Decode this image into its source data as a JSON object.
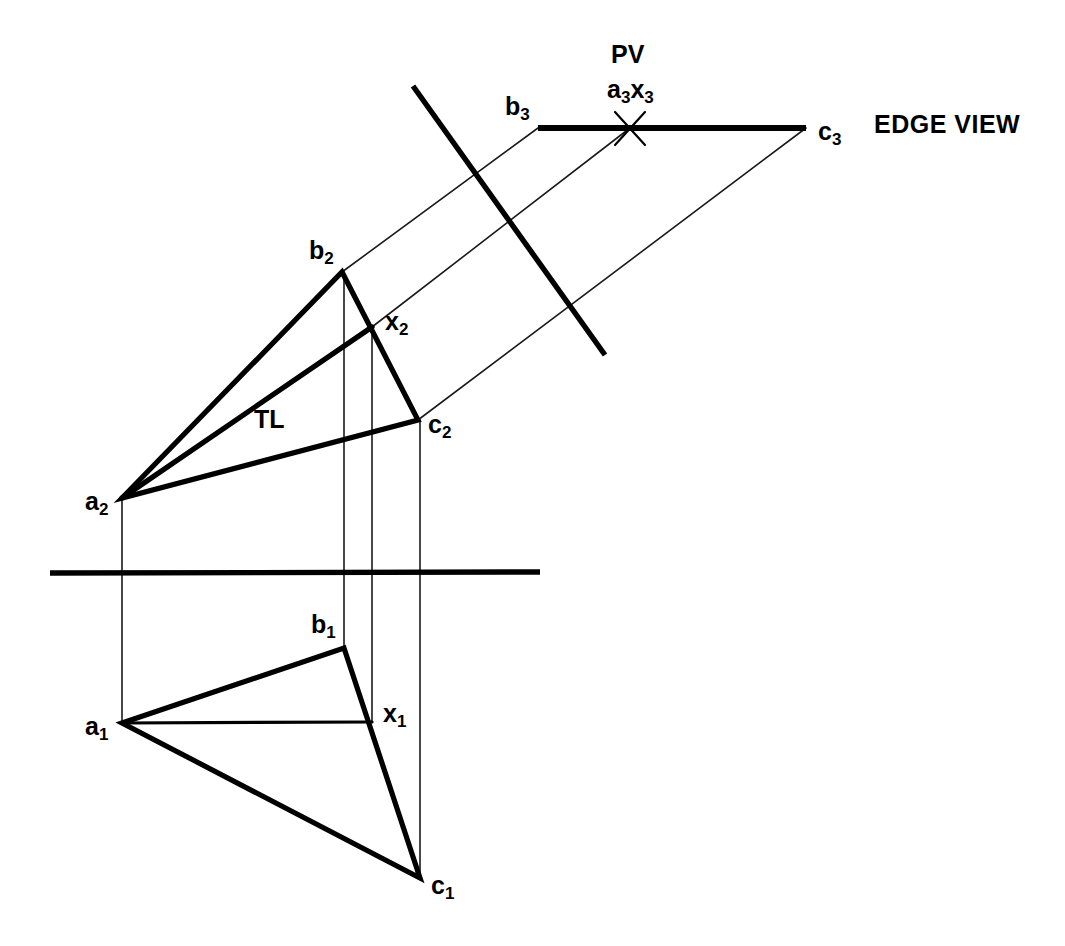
{
  "drawing": {
    "title": "Descriptive geometry - edge view of a plane",
    "background_color": "#ffffff",
    "ink_color": "#000000",
    "canvas": {
      "width": 1065,
      "height": 946
    }
  },
  "labels": {
    "pv": "PV",
    "a3x3": {
      "base1": "a",
      "sub1": "3",
      "base2": "x",
      "sub2": "3"
    },
    "b3": {
      "base": "b",
      "sub": "3"
    },
    "c3": {
      "base": "c",
      "sub": "3"
    },
    "edge_view": "EDGE VIEW",
    "b2": {
      "base": "b",
      "sub": "2"
    },
    "x2": {
      "base": "x",
      "sub": "2"
    },
    "c2": {
      "base": "c",
      "sub": "2"
    },
    "a2": {
      "base": "a",
      "sub": "2"
    },
    "tl": "TL",
    "b1": {
      "base": "b",
      "sub": "1"
    },
    "x1": {
      "base": "x",
      "sub": "1"
    },
    "a1": {
      "base": "a",
      "sub": "1"
    },
    "c1": {
      "base": "c",
      "sub": "1"
    }
  },
  "points": {
    "a1": {
      "x": 122,
      "y": 723,
      "label": "a1",
      "view": "top"
    },
    "b1": {
      "x": 344,
      "y": 648,
      "label": "b1",
      "view": "top"
    },
    "c1": {
      "x": 420,
      "y": 878,
      "label": "c1",
      "view": "top"
    },
    "x1": {
      "x": 372,
      "y": 722,
      "label": "x1",
      "view": "top"
    },
    "a2": {
      "x": 122,
      "y": 498,
      "label": "a2",
      "view": "front"
    },
    "b2": {
      "x": 342,
      "y": 272,
      "label": "b2",
      "view": "front"
    },
    "c2": {
      "x": 418,
      "y": 420,
      "label": "c2",
      "view": "front"
    },
    "x2": {
      "x": 372,
      "y": 327,
      "label": "x2",
      "view": "front"
    },
    "b3": {
      "x": 538,
      "y": 128,
      "label": "b3",
      "view": "auxiliary"
    },
    "a3x3": {
      "x": 630,
      "y": 128,
      "label": "a3x3",
      "view": "auxiliary"
    },
    "c3": {
      "x": 806,
      "y": 128,
      "label": "c3",
      "view": "auxiliary"
    }
  },
  "geometry": {
    "fold_line_horizontal": {
      "x1": 50,
      "y1": 573,
      "x2": 540,
      "y2": 572,
      "stroke_width": 5
    },
    "fold_line_diagonal": {
      "x1": 413,
      "y1": 86,
      "x2": 605,
      "y2": 355,
      "stroke_width": 5
    },
    "edge_view_line": {
      "x1": 538,
      "y1": 128,
      "x2": 806,
      "y2": 128,
      "stroke_width": 6
    },
    "pv_cross_mark": {
      "cx": 630,
      "cy": 128,
      "arm": 17,
      "angle_deg": 65,
      "stroke_width": 2
    },
    "triangle_front": {
      "vertices": [
        "a2",
        "b2",
        "c2"
      ],
      "stroke_width": 5
    },
    "triangle_top": {
      "vertices": [
        "a1",
        "b1",
        "c1"
      ],
      "stroke_width": 5
    },
    "tl_line_front": {
      "from": "a2",
      "to": "x2",
      "stroke_width": 5,
      "annotation": "TL"
    },
    "tl_line_top": {
      "from": "a1",
      "to": "x1",
      "stroke_width": 3
    },
    "vertical_projectors": [
      {
        "x": 122,
        "y1": 498,
        "y2": 723,
        "stroke_width": 1.6
      },
      {
        "x": 344,
        "y1": 272,
        "y2": 648,
        "stroke_width": 1.6
      },
      {
        "x": 372,
        "y1": 327,
        "y2": 722,
        "stroke_width": 1.6
      },
      {
        "x": 420,
        "y1": 420,
        "y2": 878,
        "stroke_width": 1.6
      }
    ],
    "auxiliary_projectors": [
      {
        "from": "b2",
        "to": "b3",
        "stroke_width": 1.6
      },
      {
        "from": "x2",
        "to": "a3x3",
        "stroke_width": 1.6
      },
      {
        "from": "c2",
        "to": "c3",
        "stroke_width": 1.6
      }
    ]
  }
}
